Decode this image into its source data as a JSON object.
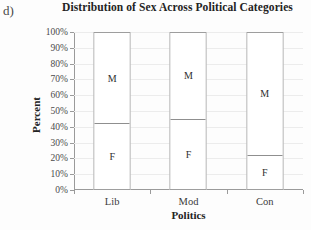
{
  "panel_label": "d)",
  "chart_data": {
    "type": "bar",
    "subtype": "stacked-100-percent",
    "title": "Distribution of Sex Across Political Categories",
    "xlabel": "Politics",
    "ylabel": "Percent",
    "categories": [
      "Lib",
      "Mod",
      "Con"
    ],
    "ylim": [
      0,
      100
    ],
    "ytick_labels": [
      "0%",
      "10%",
      "20%",
      "30%",
      "40%",
      "50%",
      "60%",
      "70%",
      "80%",
      "90%",
      "100%"
    ],
    "ytick_values": [
      0,
      10,
      20,
      30,
      40,
      50,
      60,
      70,
      80,
      90,
      100
    ],
    "grid": true,
    "legend": "none",
    "series": [
      {
        "name": "F",
        "label": "F",
        "values": [
          42,
          45,
          22
        ]
      },
      {
        "name": "M",
        "label": "M",
        "values": [
          58,
          55,
          78
        ]
      }
    ],
    "bar_outline_color": "#9e9e9e",
    "bar_fill_color": "#ffffff",
    "gridline_color": "#ececec",
    "axis_color": "#9a9a9a"
  }
}
